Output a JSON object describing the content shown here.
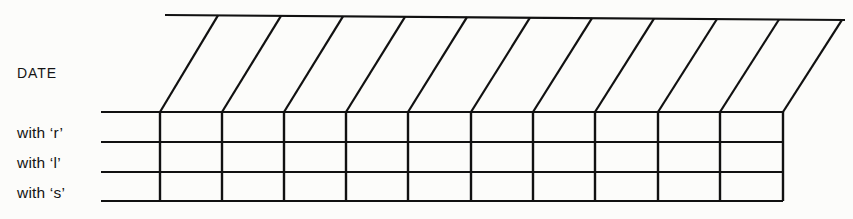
{
  "figure": {
    "type": "table-skeleton-diagram",
    "background_color": "#fcfcfa",
    "line_color": "#111111",
    "header": {
      "label": "DATE",
      "face": "slanted-top"
    },
    "rows": [
      {
        "label": "with ‘r’"
      },
      {
        "label": "with ‘l’"
      },
      {
        "label": "with ‘s’"
      }
    ],
    "grid": {
      "columns": 10,
      "row_count": 3,
      "vertical_line_x": [
        160,
        222,
        284,
        346,
        408,
        471,
        533,
        595,
        658,
        720,
        783
      ],
      "horizontal_line_y": [
        112,
        142,
        172,
        201
      ],
      "horizontal_line_x_start": 101,
      "slant_top_x": [
        218,
        281,
        343,
        405,
        467,
        530,
        592,
        654,
        717,
        779,
        842
      ],
      "top_edge_x_start": 165,
      "top_edge_y_start": 15,
      "top_edge_y_end": 20
    }
  }
}
